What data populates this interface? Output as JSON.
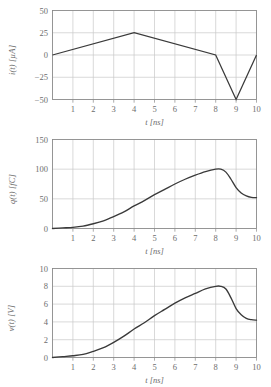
{
  "figure": {
    "background": "#ffffff",
    "curve_color": "#3a3a3a",
    "grid_color": "#c9c9c9",
    "frame_color": "#8a8a8a",
    "text_color": "#6d6d6d"
  },
  "chart_data": [
    {
      "type": "line",
      "title": "",
      "xlabel": "t [ns]",
      "ylabel": "i(t) [µA]",
      "xlim": [
        0,
        10
      ],
      "ylim": [
        -50,
        50
      ],
      "xticks": [
        1,
        2,
        3,
        4,
        5,
        6,
        7,
        8,
        9,
        10
      ],
      "xticklabels": [
        "1",
        "2",
        "3",
        "4",
        "5",
        "6",
        "7",
        "8",
        "9",
        "10"
      ],
      "yticks": [
        -50,
        -25,
        0,
        25,
        50
      ],
      "yticklabels": [
        "-50",
        "-25",
        "0",
        "25",
        "50"
      ],
      "grid": true,
      "legend": "none",
      "series": [
        {
          "name": "i(t)",
          "x": [
            0,
            4,
            8,
            9,
            10
          ],
          "values": [
            0,
            25,
            0,
            -50,
            0
          ]
        }
      ],
      "annotations": []
    },
    {
      "type": "line",
      "title": "",
      "xlabel": "t [ns]",
      "ylabel": "q(t) [fC]",
      "xlim": [
        0,
        10
      ],
      "ylim": [
        0,
        150
      ],
      "xticks": [
        1,
        2,
        3,
        4,
        5,
        6,
        7,
        8,
        9,
        10
      ],
      "xticklabels": [
        "1",
        "2",
        "3",
        "4",
        "5",
        "6",
        "7",
        "8",
        "9",
        "10"
      ],
      "yticks": [
        0,
        50,
        100,
        150
      ],
      "yticklabels": [
        "0",
        "50",
        "100",
        "150"
      ],
      "grid": true,
      "legend": "none",
      "series": [
        {
          "name": "q(t)",
          "x": [
            0,
            0.5,
            1,
            1.5,
            2,
            2.5,
            3,
            3.5,
            4,
            4.5,
            5,
            5.5,
            6,
            6.5,
            7,
            7.5,
            8,
            8.25,
            8.5,
            8.75,
            9,
            9.25,
            9.5,
            9.75,
            10
          ],
          "values": [
            0,
            1,
            2,
            4,
            8,
            13,
            20,
            28,
            38,
            47,
            57,
            66,
            75,
            83,
            90,
            96,
            100,
            100,
            95,
            83,
            69,
            60,
            55,
            52.5,
            52
          ]
        }
      ],
      "annotations": []
    },
    {
      "type": "line",
      "title": "",
      "xlabel": "t [ns]",
      "ylabel": "v(t) [V]",
      "xlim": [
        0,
        10
      ],
      "ylim": [
        0,
        10
      ],
      "xticks": [
        1,
        2,
        3,
        4,
        5,
        6,
        7,
        8,
        9,
        10
      ],
      "xticklabels": [
        "1",
        "2",
        "3",
        "4",
        "5",
        "6",
        "7",
        "8",
        "9",
        "10"
      ],
      "yticks": [
        0,
        2,
        4,
        6,
        8,
        10
      ],
      "yticklabels": [
        "0",
        "2",
        "4",
        "6",
        "8",
        "10"
      ],
      "grid": true,
      "legend": "none",
      "series": [
        {
          "name": "v(t)",
          "x": [
            0,
            0.5,
            1,
            1.5,
            2,
            2.5,
            3,
            3.5,
            4,
            4.5,
            5,
            5.5,
            6,
            6.5,
            7,
            7.5,
            8,
            8.25,
            8.5,
            8.75,
            9,
            9.25,
            9.5,
            9.75,
            10
          ],
          "values": [
            0,
            0.1,
            0.2,
            0.35,
            0.7,
            1.1,
            1.7,
            2.4,
            3.2,
            3.9,
            4.7,
            5.4,
            6.1,
            6.7,
            7.2,
            7.7,
            8.0,
            8.0,
            7.7,
            6.7,
            5.5,
            4.8,
            4.4,
            4.25,
            4.2
          ]
        }
      ]
    }
  ]
}
